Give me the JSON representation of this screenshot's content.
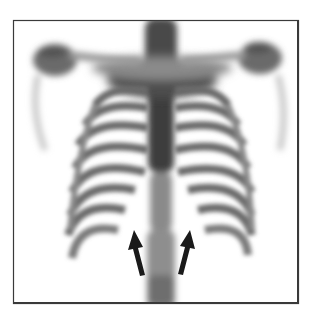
{
  "image": {
    "kind": "bone scintigraphy (anterior chest view)",
    "description": "Grayscale nuclear medicine scan of the thorax showing ribs, spine, clavicles and shoulders, with two black arrows pointing upward at the lower costal region",
    "frame_color": "#3a3a3a",
    "tracer_color": "#5a5a5a",
    "background_color": "#ffffff"
  },
  "annotations": {
    "arrows": [
      {
        "name": "left-arrow",
        "direction": "up",
        "color": "#1a1a1a"
      },
      {
        "name": "right-arrow",
        "direction": "up",
        "color": "#1a1a1a"
      }
    ]
  }
}
